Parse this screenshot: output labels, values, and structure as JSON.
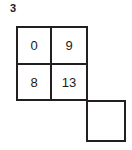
{
  "figure": {
    "label": "3",
    "background_color": "#ffffff",
    "line_color": "#231f20",
    "text_color": "#1a1a1a"
  },
  "grid": {
    "rows": 2,
    "columns": 2,
    "cells": [
      {
        "row": 0,
        "col": 0,
        "value": "0"
      },
      {
        "row": 0,
        "col": 1,
        "value": "9"
      },
      {
        "row": 1,
        "col": 0,
        "value": "8"
      },
      {
        "row": 1,
        "col": 1,
        "value": "13"
      }
    ]
  },
  "detached_cell": {
    "value": "",
    "position": "below-right-of-grid"
  }
}
